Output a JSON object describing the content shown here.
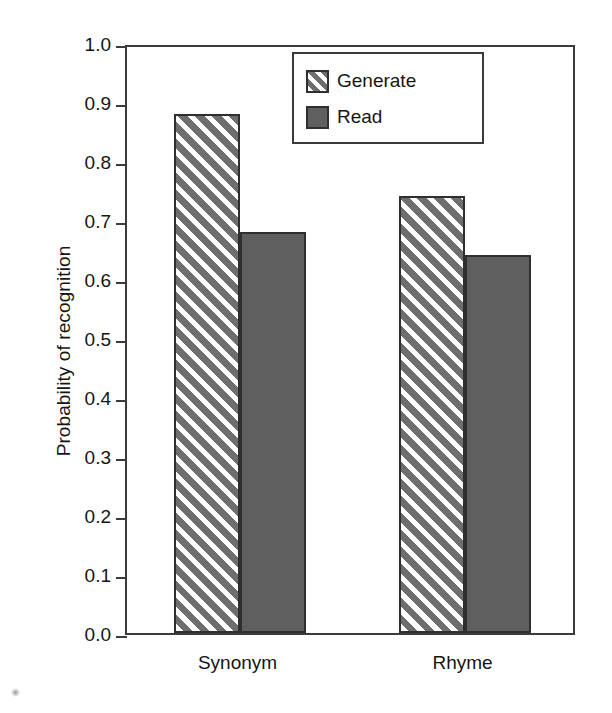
{
  "chart_data": {
    "type": "bar",
    "title": "",
    "xlabel": "",
    "ylabel": "Probability of recognition",
    "categories": [
      "Synonym",
      "Rhyme"
    ],
    "series": [
      {
        "name": "Generate",
        "values": [
          0.88,
          0.74
        ],
        "pattern": "diagonal-hatch",
        "color": "#6e6e6e"
      },
      {
        "name": "Read",
        "values": [
          0.68,
          0.64
        ],
        "pattern": "solid",
        "color": "#605f5f"
      }
    ],
    "ylim": [
      0.0,
      1.0
    ],
    "ytick_step": 0.1,
    "ytick_labels": [
      "0.0",
      "0.1",
      "0.2",
      "0.3",
      "0.4",
      "0.5",
      "0.6",
      "0.7",
      "0.8",
      "0.9",
      "1.0"
    ],
    "grid": false,
    "legend_position": "top-right",
    "frame": "box"
  },
  "axis": {
    "y_title": "Probability of recognition",
    "y_ticks": [
      {
        "label": "1.0",
        "value": 1.0
      },
      {
        "label": "0.9",
        "value": 0.9
      },
      {
        "label": "0.8",
        "value": 0.8
      },
      {
        "label": "0.7",
        "value": 0.7
      },
      {
        "label": "0.6",
        "value": 0.6
      },
      {
        "label": "0.5",
        "value": 0.5
      },
      {
        "label": "0.4",
        "value": 0.4
      },
      {
        "label": "0.3",
        "value": 0.3
      },
      {
        "label": "0.2",
        "value": 0.2
      },
      {
        "label": "0.1",
        "value": 0.1
      },
      {
        "label": "0.0",
        "value": 0.0
      }
    ],
    "x_categories": [
      {
        "label": "Synonym"
      },
      {
        "label": "Rhyme"
      }
    ]
  },
  "bars": [
    {
      "category": "Synonym",
      "series": "Generate",
      "value": 0.88
    },
    {
      "category": "Synonym",
      "series": "Read",
      "value": 0.68
    },
    {
      "category": "Rhyme",
      "series": "Generate",
      "value": 0.74
    },
    {
      "category": "Rhyme",
      "series": "Read",
      "value": 0.64
    }
  ],
  "legend": {
    "entries": [
      {
        "label": "Generate",
        "style": "diagonal-hatch"
      },
      {
        "label": "Read",
        "style": "solid"
      }
    ]
  },
  "colors": {
    "hatch_fill": "#6e6e6e",
    "solid_fill": "#605f5f",
    "outline": "#2f2f2f",
    "axis": "#3b3b3b",
    "background": "#ffffff",
    "text": "#151515"
  }
}
